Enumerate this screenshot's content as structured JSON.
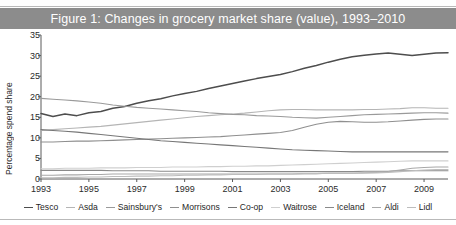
{
  "figure": {
    "caption": "Figure 1: Changes in grocery market share (value), 1993–2010",
    "caption_band_color": "#8c8c8c",
    "caption_text_color": "#ffffff",
    "background_color": "#ffffff"
  },
  "chart_data": {
    "type": "line",
    "title": "Figure 1: Changes in grocery market share (value), 1993–2010",
    "xlabel": "",
    "ylabel": "Percentage spend share",
    "xlim": [
      1993,
      2010
    ],
    "ylim": [
      0,
      35
    ],
    "yticks": [
      0,
      5,
      10,
      15,
      20,
      25,
      30,
      35
    ],
    "xticks": [
      1993,
      1995,
      1997,
      1999,
      2001,
      2003,
      2005,
      2007,
      2009
    ],
    "grid": false,
    "legend_position": "bottom",
    "x": [
      1993,
      1993.5,
      1994,
      1994.5,
      1995,
      1995.5,
      1996,
      1996.5,
      1997,
      1997.5,
      1998,
      1998.5,
      1999,
      1999.5,
      2000,
      2000.5,
      2001,
      2001.5,
      2002,
      2002.5,
      2003,
      2003.5,
      2004,
      2004.5,
      2005,
      2005.5,
      2006,
      2006.5,
      2007,
      2007.5,
      2008,
      2008.5,
      2009,
      2009.5,
      2010
    ],
    "series": [
      {
        "name": "Tesco",
        "color": "#4d4d4d",
        "width": 1.5,
        "values": [
          15.9,
          15.2,
          15.8,
          15.4,
          16.1,
          16.4,
          17.2,
          17.6,
          18.4,
          19.0,
          19.5,
          20.2,
          20.8,
          21.3,
          22.0,
          22.6,
          23.2,
          23.8,
          24.4,
          24.9,
          25.4,
          26.1,
          26.9,
          27.6,
          28.4,
          29.1,
          29.7,
          30.1,
          30.4,
          30.6,
          30.3,
          30.0,
          30.3,
          30.6,
          30.7
        ]
      },
      {
        "name": "Asda",
        "color": "#b5b5b5",
        "width": 1.1,
        "values": [
          11.8,
          12.0,
          12.2,
          12.4,
          12.6,
          12.8,
          13.1,
          13.4,
          13.7,
          14.0,
          14.3,
          14.6,
          14.9,
          15.2,
          15.4,
          15.6,
          15.8,
          16.0,
          16.3,
          16.6,
          16.8,
          16.9,
          16.9,
          16.8,
          16.8,
          16.8,
          16.8,
          16.9,
          16.9,
          17.0,
          17.1,
          17.3,
          17.3,
          17.2,
          17.2
        ]
      },
      {
        "name": "Sainsbury's",
        "color": "#9a9a9a",
        "width": 1.1,
        "values": [
          19.6,
          19.4,
          19.2,
          19.0,
          18.7,
          18.4,
          18.0,
          17.7,
          17.4,
          17.2,
          17.0,
          16.8,
          16.6,
          16.4,
          16.1,
          15.9,
          15.7,
          15.6,
          15.4,
          15.3,
          15.2,
          15.0,
          14.9,
          14.8,
          15.0,
          15.2,
          15.4,
          15.6,
          15.7,
          15.8,
          15.9,
          16.0,
          16.1,
          16.1,
          16.0
        ]
      },
      {
        "name": "Morrisons",
        "color": "#8f8f8f",
        "width": 1.1,
        "values": [
          9.0,
          9.0,
          9.1,
          9.2,
          9.2,
          9.3,
          9.4,
          9.5,
          9.6,
          9.7,
          9.8,
          9.9,
          10.0,
          10.1,
          10.2,
          10.3,
          10.5,
          10.7,
          10.9,
          11.1,
          11.3,
          11.8,
          12.6,
          13.3,
          13.8,
          14.0,
          13.9,
          13.8,
          13.8,
          13.9,
          14.1,
          14.3,
          14.5,
          14.6,
          14.6
        ]
      },
      {
        "name": "Co-op",
        "color": "#777777",
        "width": 1.1,
        "values": [
          12.0,
          11.8,
          11.6,
          11.4,
          11.1,
          10.8,
          10.5,
          10.2,
          9.9,
          9.6,
          9.3,
          9.1,
          8.9,
          8.7,
          8.5,
          8.3,
          8.1,
          7.9,
          7.7,
          7.5,
          7.3,
          7.1,
          7.0,
          6.9,
          6.8,
          6.7,
          6.6,
          6.6,
          6.6,
          6.6,
          6.6,
          6.6,
          6.6,
          6.6,
          6.6
        ]
      },
      {
        "name": "Waitrose",
        "color": "#cfcfcf",
        "width": 1.1,
        "values": [
          2.5,
          2.5,
          2.6,
          2.6,
          2.6,
          2.7,
          2.7,
          2.7,
          2.8,
          2.8,
          2.8,
          2.9,
          2.9,
          2.9,
          3.0,
          3.0,
          3.1,
          3.1,
          3.2,
          3.2,
          3.3,
          3.4,
          3.5,
          3.6,
          3.7,
          3.8,
          3.9,
          4.0,
          4.1,
          4.2,
          4.3,
          4.4,
          4.4,
          4.4,
          4.4
        ]
      },
      {
        "name": "Iceland",
        "color": "#8a8a8a",
        "width": 1.1,
        "values": [
          2.1,
          2.1,
          2.1,
          2.1,
          2.1,
          2.1,
          2.0,
          2.0,
          2.0,
          2.0,
          1.9,
          1.9,
          1.9,
          1.9,
          1.9,
          1.9,
          1.8,
          1.8,
          1.8,
          1.8,
          1.8,
          1.8,
          1.8,
          1.8,
          1.8,
          1.8,
          1.8,
          1.9,
          1.9,
          1.9,
          2.0,
          2.0,
          2.0,
          2.0,
          2.0
        ]
      },
      {
        "name": "Aldi",
        "color": "#a8a8a8",
        "width": 1.1,
        "values": [
          0.9,
          0.9,
          1.0,
          1.0,
          1.1,
          1.1,
          1.2,
          1.2,
          1.2,
          1.2,
          1.2,
          1.2,
          1.2,
          1.2,
          1.2,
          1.2,
          1.2,
          1.2,
          1.2,
          1.2,
          1.2,
          1.2,
          1.3,
          1.3,
          1.4,
          1.4,
          1.4,
          1.5,
          1.6,
          1.8,
          2.2,
          2.6,
          2.8,
          2.9,
          2.9
        ]
      },
      {
        "name": "Lidl",
        "color": "#bdbdbd",
        "width": 1.1,
        "values": [
          0.3,
          0.3,
          0.4,
          0.4,
          0.5,
          0.5,
          0.6,
          0.6,
          0.7,
          0.7,
          0.8,
          0.8,
          0.9,
          0.9,
          1.0,
          1.0,
          1.1,
          1.1,
          1.1,
          1.2,
          1.2,
          1.2,
          1.3,
          1.3,
          1.4,
          1.4,
          1.4,
          1.5,
          1.5,
          1.6,
          1.8,
          2.0,
          2.2,
          2.3,
          2.3
        ]
      }
    ]
  }
}
